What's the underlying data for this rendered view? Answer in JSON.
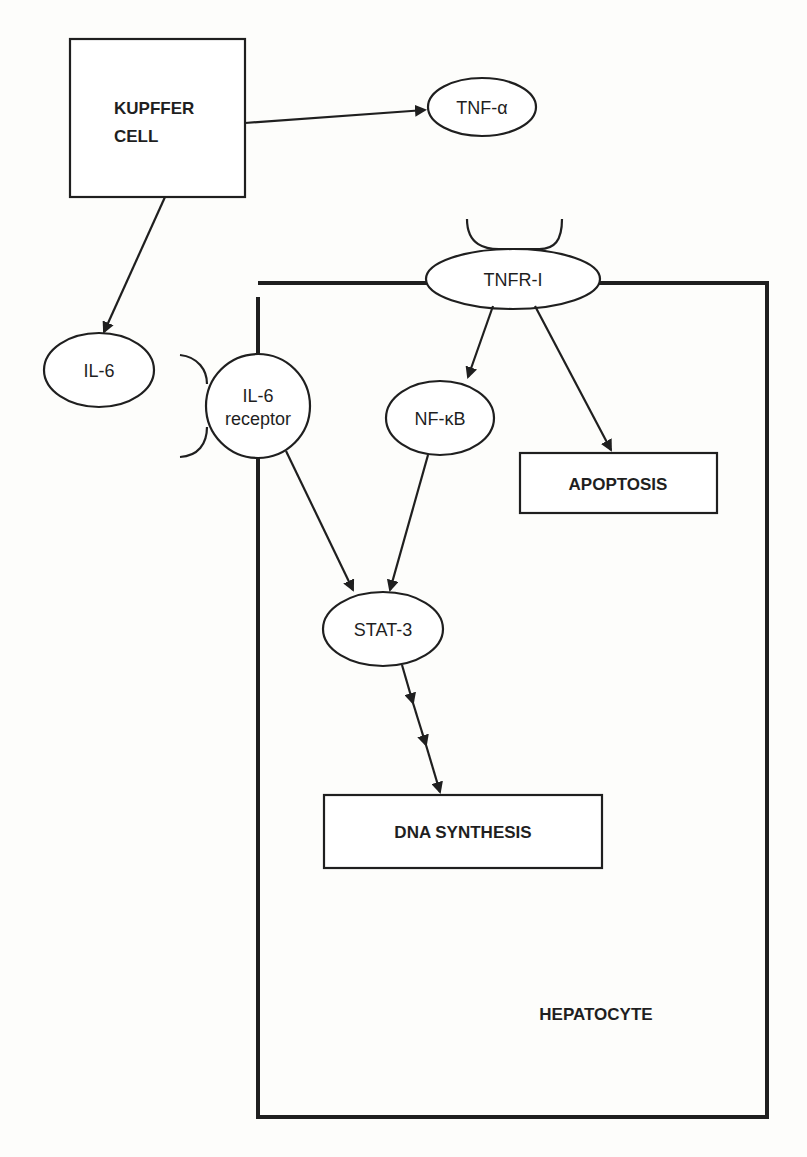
{
  "diagram": {
    "type": "signaling-pathway",
    "nodes": {
      "kupffer_cell": {
        "line1": "KUPFFER",
        "line2": "CELL",
        "shape": "box"
      },
      "tnf_alpha": {
        "label": "TNF-α",
        "shape": "ellipse"
      },
      "il6": {
        "label": "IL-6",
        "shape": "ellipse"
      },
      "tnfr1": {
        "label": "TNFR-I",
        "shape": "ellipse"
      },
      "il6_receptor": {
        "line1": "IL-6",
        "line2": "receptor",
        "shape": "circle"
      },
      "nfkb": {
        "label": "NF-κB",
        "shape": "ellipse"
      },
      "apoptosis": {
        "label": "APOPTOSIS",
        "shape": "box"
      },
      "stat3": {
        "label": "STAT-3",
        "shape": "ellipse"
      },
      "dna_synthesis": {
        "label": "DNA SYNTHESIS",
        "shape": "box"
      },
      "hepatocyte": {
        "label": "HEPATOCYTE",
        "shape": "container"
      }
    },
    "edges": [
      {
        "from": "KUPFFER CELL",
        "to": "TNF-α"
      },
      {
        "from": "KUPFFER CELL",
        "to": "IL-6"
      },
      {
        "from": "TNFR-I",
        "to": "NF-κB"
      },
      {
        "from": "TNFR-I",
        "to": "APOPTOSIS"
      },
      {
        "from": "IL-6 receptor",
        "to": "STAT-3"
      },
      {
        "from": "NF-κB",
        "to": "STAT-3"
      },
      {
        "from": "STAT-3",
        "to": "DNA SYNTHESIS",
        "style": "multi-step"
      }
    ],
    "colors": {
      "ink": "#1f1f1f",
      "background": "#fdfdfb"
    }
  }
}
